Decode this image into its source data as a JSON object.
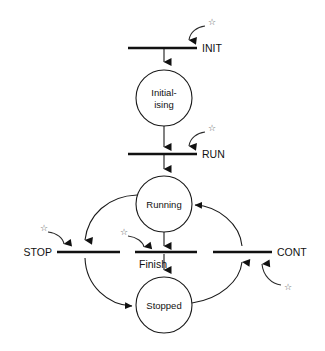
{
  "diagram": {
    "type": "petri-net",
    "background_color": "#ffffff",
    "line_color": "#1a1a1a",
    "text_color": "#111111",
    "star_color": "#555555",
    "star_glyph": "☆",
    "places": [
      {
        "id": "initialising",
        "label_line1": "Initial-",
        "label_line2": "ising",
        "cx": 164,
        "cy": 98,
        "r": 28
      },
      {
        "id": "running",
        "label_line1": "Running",
        "label_line2": "",
        "cx": 164,
        "cy": 204,
        "r": 28
      },
      {
        "id": "stopped",
        "label_line1": "Stopped",
        "label_line2": "",
        "cx": 164,
        "cy": 305,
        "r": 28
      }
    ],
    "transitions": [
      {
        "id": "init",
        "label": "INIT",
        "x1": 128,
        "x2": 197,
        "y": 48,
        "label_x": 202,
        "label_y": 52,
        "label_anchor": "start"
      },
      {
        "id": "run",
        "label": "RUN",
        "x1": 128,
        "x2": 197,
        "y": 154,
        "label_x": 202,
        "label_y": 158,
        "label_anchor": "start"
      },
      {
        "id": "stop",
        "label": "STOP",
        "x1": 57,
        "x2": 120,
        "y": 252,
        "label_x": 52,
        "label_y": 256,
        "label_anchor": "end"
      },
      {
        "id": "finish",
        "label": "Finish",
        "x1": 135,
        "x2": 197,
        "y": 252,
        "label_x": 139,
        "label_y": 268,
        "label_anchor": "start"
      },
      {
        "id": "cont",
        "label": "CONT",
        "x1": 213,
        "x2": 272,
        "y": 252,
        "label_x": 277,
        "label_y": 256,
        "label_anchor": "start"
      }
    ],
    "external_events": [
      {
        "id": "init-event",
        "for": "INIT",
        "star_x": 208,
        "star_y": 22
      },
      {
        "id": "run-event",
        "for": "RUN",
        "star_x": 208,
        "star_y": 128
      },
      {
        "id": "stop-event",
        "for": "STOP",
        "star_x": 40,
        "star_y": 228
      },
      {
        "id": "finish-event",
        "for": "Finish",
        "star_x": 120,
        "star_y": 232
      },
      {
        "id": "cont-event",
        "for": "CONT",
        "star_x": 284,
        "star_y": 288
      }
    ],
    "arcs": [
      {
        "id": "init-to-initialising",
        "from": "INIT",
        "to": "Initialising",
        "kind": "vertical-down"
      },
      {
        "id": "initialising-to-run",
        "from": "Initialising",
        "to": "RUN",
        "kind": "vertical-down"
      },
      {
        "id": "run-to-running",
        "from": "RUN",
        "to": "Running",
        "kind": "vertical-down"
      },
      {
        "id": "running-to-finish",
        "from": "Running",
        "to": "Finish",
        "kind": "vertical-down"
      },
      {
        "id": "finish-to-stopped",
        "from": "Finish",
        "to": "Stopped",
        "kind": "vertical-down"
      },
      {
        "id": "running-to-stop",
        "from": "Running",
        "to": "STOP",
        "kind": "curve-left-down"
      },
      {
        "id": "stop-to-stopped",
        "from": "STOP",
        "to": "Stopped",
        "kind": "curve-left-down"
      },
      {
        "id": "stopped-to-cont",
        "from": "Stopped",
        "to": "CONT",
        "kind": "curve-right-up"
      },
      {
        "id": "cont-to-running",
        "from": "CONT",
        "to": "Running",
        "kind": "curve-right-up"
      }
    ]
  }
}
